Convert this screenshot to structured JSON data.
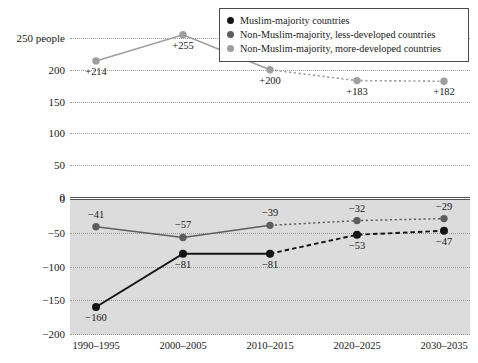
{
  "figure": {
    "clipped_title_remnant": "",
    "upper_axis_unit_label": "people"
  },
  "legend": {
    "items": [
      {
        "label": "Muslim-majority countries",
        "color": "#141414",
        "key": "muslim"
      },
      {
        "label": "Non-Muslim-majority, less-developed countries",
        "color": "#5d5d5d",
        "key": "less_developed"
      },
      {
        "label": "Non-Muslim-majority, more-developed countries",
        "color": "#9e9e9e",
        "key": "more_developed"
      }
    ]
  },
  "chart_data": {
    "type": "line",
    "title": "",
    "xlabel": "",
    "ylabel": "",
    "grid": true,
    "legend_position": "top-right",
    "categories": [
      "1990–1995",
      "2000–2005",
      "2010–2015",
      "2020–2025",
      "2030–2035"
    ],
    "panels": [
      {
        "name": "upper",
        "ylim": [
          0,
          265
        ],
        "yticks": [
          0,
          50,
          100,
          150,
          200,
          250
        ],
        "ytick_labels": [
          "0",
          "50",
          "100",
          "150",
          "200",
          "250 people"
        ],
        "series": [
          {
            "name": "Non-Muslim-majority, more-developed countries",
            "color": "#9e9e9e",
            "values": [
              214,
              255,
              200,
              183,
              182
            ],
            "point_labels": [
              "+214",
              "+255",
              "+200",
              "+183",
              "+182"
            ],
            "projected_from_index": 2
          }
        ]
      },
      {
        "name": "lower",
        "ylim": [
          -200,
          0
        ],
        "yticks": [
          0,
          -50,
          -100,
          -150,
          -200
        ],
        "ytick_labels": [
          "0",
          "−50",
          "−100",
          "−150",
          "−200"
        ],
        "series": [
          {
            "name": "Muslim-majority countries",
            "color": "#141414",
            "values": [
              -160,
              -81,
              -81,
              -53,
              -47
            ],
            "point_labels": [
              "−160",
              "−81",
              "−81",
              "−53",
              "−47"
            ],
            "projected_from_index": 2
          },
          {
            "name": "Non-Muslim-majority, less-developed countries",
            "color": "#5d5d5d",
            "values": [
              -41,
              -57,
              -39,
              -32,
              -29
            ],
            "point_labels": [
              "−41",
              "−57",
              "−39",
              "−32",
              "−29"
            ],
            "projected_from_index": 2
          }
        ]
      }
    ]
  },
  "axes": {
    "upper_yticks": [
      {
        "value": 250,
        "label": "250 people"
      },
      {
        "value": 200,
        "label": "200"
      },
      {
        "value": 150,
        "label": "150"
      },
      {
        "value": 100,
        "label": "100"
      },
      {
        "value": 50,
        "label": "50"
      },
      {
        "value": 0,
        "label": "0"
      }
    ],
    "lower_yticks": [
      {
        "value": 0,
        "label": "0"
      },
      {
        "value": -50,
        "label": "−50"
      },
      {
        "value": -100,
        "label": "−100"
      },
      {
        "value": -150,
        "label": "−150"
      },
      {
        "value": -200,
        "label": "−200"
      }
    ],
    "xticks": [
      "1990–1995",
      "2000–2005",
      "2010–2015",
      "2020–2025",
      "2030–2035"
    ]
  }
}
